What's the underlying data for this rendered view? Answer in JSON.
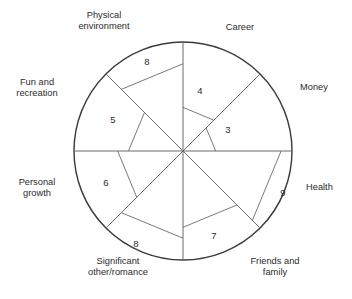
{
  "figure": {
    "kind": "wheel-of-life",
    "center": {
      "x": 183,
      "y": 151
    },
    "radius": 109,
    "scale_max": 10,
    "circle_stroke": "#3a3a3a",
    "line_stroke": "#6b6b6b",
    "text_color": "#2b2b2b",
    "background": "#ffffff"
  },
  "chart_data": {
    "type": "radar",
    "title": "",
    "xlabel": "",
    "ylabel": "",
    "rlim": [
      0,
      10
    ],
    "grid": false,
    "legend": "none",
    "categories": [
      "Career",
      "Money",
      "Health",
      "Friends and family",
      "Significant other/romance",
      "Personal growth",
      "Fun and recreation",
      "Physical environment"
    ],
    "values": [
      4,
      3,
      9,
      7,
      8,
      6,
      5,
      8
    ],
    "series": [
      {
        "name": "Satisfaction score",
        "values": [
          4,
          3,
          9,
          7,
          8,
          6,
          5,
          8
        ]
      }
    ],
    "angles_deg": [
      67.5,
      22.5,
      -22.5,
      -67.5,
      -112.5,
      -157.5,
      157.5,
      112.5
    ]
  },
  "sectors": [
    {
      "id": "career",
      "label": "Career",
      "label_lines": "Career",
      "value": 4,
      "value_text": "4",
      "a0": 90,
      "a1": 45,
      "label_pos": {
        "x": 200,
        "y": 91
      }
    },
    {
      "id": "money",
      "label": "Money",
      "label_lines": "Money",
      "value": 3,
      "value_text": "3",
      "a0": 45,
      "a1": 0,
      "label_pos": {
        "x": 228,
        "y": 130
      }
    },
    {
      "id": "health",
      "label": "Health",
      "label_lines": "Health",
      "value": 9,
      "value_text": "9",
      "a0": 0,
      "a1": -45,
      "label_pos": {
        "x": 283,
        "y": 193
      }
    },
    {
      "id": "friends-family",
      "label": "Friends and family",
      "label_lines": "Friends and\nfamily",
      "value": 7,
      "value_text": "7",
      "a0": -45,
      "a1": -90,
      "label_pos": {
        "x": 214,
        "y": 236
      }
    },
    {
      "id": "significant-other",
      "label": "Significant other/romance",
      "label_lines": "Significant\nother/romance",
      "value": 8,
      "value_text": "8",
      "a0": -90,
      "a1": -135,
      "label_pos": {
        "x": 136,
        "y": 244
      }
    },
    {
      "id": "personal-growth",
      "label": "Personal growth",
      "label_lines": "Personal\ngrowth",
      "value": 6,
      "value_text": "6",
      "a0": -135,
      "a1": 180,
      "label_pos": {
        "x": 106,
        "y": 183
      }
    },
    {
      "id": "fun-recreation",
      "label": "Fun and recreation",
      "label_lines": "Fun and\nrecreation",
      "value": 5,
      "value_text": "5",
      "a0": 180,
      "a1": 135,
      "label_pos": {
        "x": 113,
        "y": 120
      }
    },
    {
      "id": "physical-environment",
      "label": "Physical environment",
      "label_lines": "Physical\nenvironment",
      "value": 8,
      "value_text": "8",
      "a0": 135,
      "a1": 90,
      "label_pos": {
        "x": 147,
        "y": 62
      }
    }
  ]
}
